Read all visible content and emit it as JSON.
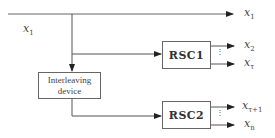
{
  "diagram": {
    "type": "turbo-encoder-block-diagram",
    "input": {
      "label": "x",
      "sub": "1"
    },
    "blocks": {
      "interleaver": {
        "line1": "Interleaving",
        "line2": "device"
      },
      "rsc1": {
        "label": "RSC1"
      },
      "rsc2": {
        "label": "RSC2"
      }
    },
    "outputs": [
      {
        "label": "x",
        "sub": "1"
      },
      {
        "label": "x",
        "sub": "2"
      },
      {
        "label": "x",
        "sub": "τ"
      },
      {
        "label": "x",
        "sub": "τ+1"
      },
      {
        "label": "x",
        "sub": "n"
      }
    ],
    "ellipsis": "⋮",
    "colors": {
      "line": "#555555",
      "text": "#333333",
      "box_border": "#666666"
    }
  }
}
